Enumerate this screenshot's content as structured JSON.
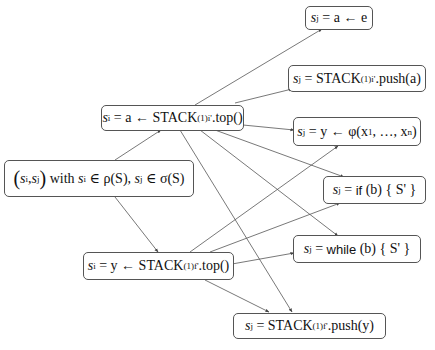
{
  "nodes": {
    "pair": {
      "label": "(s'_i, s'_j) with s_i ∈ ρ(S), s_j ∈ σ(S)",
      "prefix": "(",
      "a": "s",
      "a_sub": "i",
      "comma": ", ",
      "b": "s",
      "b_sub": "j",
      "suffix": ")",
      "with": " with ",
      "cond1": "s",
      "cond1_sub": "i",
      "cond1_rest": " ∈ ρ(S), ",
      "cond2": "s",
      "cond2_sub": "j",
      "cond2_rest": " ∈ σ(S)"
    },
    "top_i": {
      "lhs": "s",
      "lhs_sub": "i",
      "mid": " = a ← STACK",
      "stack_sub": "(1)i'",
      "rest": ".top()"
    },
    "top_f": {
      "lhs": "s",
      "lhs_sub": "i",
      "mid": " = y ← STACK",
      "stack_sub": "(1)f'",
      "rest": ".top()"
    },
    "assign": {
      "lhs": "s",
      "lhs_sub": "j",
      "rest": " = a ← e"
    },
    "push_a": {
      "lhs": "s",
      "lhs_sub": "j",
      "mid": " = STACK",
      "stack_sub": "(1)i'",
      "rest": ".push(a)"
    },
    "phi": {
      "lhs": "s",
      "lhs_sub": "j",
      "rest": " = y ← φ(x",
      "sub1": "1",
      "mid": ", …, x",
      "subn": "n",
      "end": ")"
    },
    "if": {
      "lhs": "s",
      "lhs_sub": "j",
      "eq": " = ",
      "kw": "if",
      "rest": " (b) { S' }"
    },
    "while": {
      "lhs": "s",
      "lhs_sub": "j",
      "eq": " = ",
      "kw": "while",
      "rest": " (b) { S' }"
    },
    "push_y": {
      "lhs": "s",
      "lhs_sub": "j",
      "mid": " = STACK",
      "stack_sub": "(1)f'",
      "rest": ".push(y)"
    }
  },
  "edges": [
    [
      "pair",
      "top_i"
    ],
    [
      "pair",
      "top_f"
    ],
    [
      "top_i",
      "assign"
    ],
    [
      "top_i",
      "push_a"
    ],
    [
      "top_i",
      "phi"
    ],
    [
      "top_i",
      "if"
    ],
    [
      "top_i",
      "while"
    ],
    [
      "top_i",
      "push_y"
    ],
    [
      "top_f",
      "phi"
    ],
    [
      "top_f",
      "if"
    ],
    [
      "top_f",
      "while"
    ],
    [
      "top_f",
      "push_y"
    ]
  ]
}
